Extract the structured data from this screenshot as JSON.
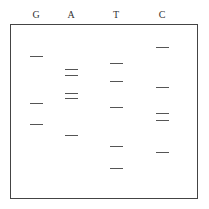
{
  "lanes": [
    {
      "label": "G",
      "x": 36,
      "bands": [
        56,
        103,
        124
      ]
    },
    {
      "label": "A",
      "x": 71,
      "bands": [
        69,
        75,
        93,
        98,
        135
      ]
    },
    {
      "label": "T",
      "x": 116,
      "bands": [
        63,
        81,
        107,
        146,
        168
      ]
    },
    {
      "label": "C",
      "x": 162,
      "bands": [
        47,
        87,
        113,
        120,
        152
      ]
    }
  ],
  "band_color": "#555555",
  "border_color": "#444444"
}
